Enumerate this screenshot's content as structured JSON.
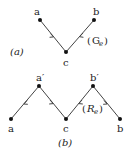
{
  "diagram_a": {
    "caption": "(a)",
    "graph_label": "G",
    "graph_label_sub": "e",
    "nodes": [
      {
        "id": "a",
        "label": "a"
      },
      {
        "id": "b",
        "label": "b"
      },
      {
        "id": "c",
        "label": "c"
      }
    ],
    "edges": [
      {
        "from": "a",
        "to": "c"
      },
      {
        "from": "b",
        "to": "c"
      }
    ]
  },
  "diagram_b": {
    "caption": "(b)",
    "graph_label": "R",
    "graph_label_sub": "e",
    "nodes": [
      {
        "id": "a_prime",
        "label": "a′"
      },
      {
        "id": "b_prime",
        "label": "b′"
      },
      {
        "id": "a",
        "label": "a"
      },
      {
        "id": "c",
        "label": "c"
      },
      {
        "id": "b",
        "label": "b"
      }
    ],
    "edges": [
      {
        "from": "a_prime",
        "to": "a"
      },
      {
        "from": "a_prime",
        "to": "c"
      },
      {
        "from": "b_prime",
        "to": "c"
      },
      {
        "from": "b_prime",
        "to": "b"
      }
    ]
  },
  "colors": {
    "node": "#111111",
    "edge": "#444444",
    "text": "#222222"
  }
}
